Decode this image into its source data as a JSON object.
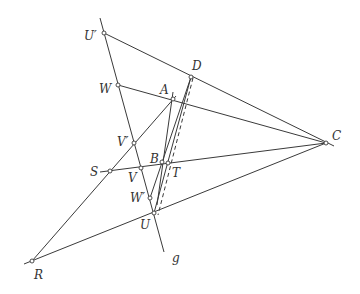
{
  "diagram": {
    "type": "projective-geometry-construction",
    "labels": {
      "U_prime": "U′",
      "D": "D",
      "W": "W",
      "A": "A",
      "C": "C",
      "V_prime": "V′",
      "S": "S",
      "B": "B",
      "T": "T",
      "V": "V",
      "W_prime": "W′",
      "U": "U",
      "R": "R",
      "g": "g"
    },
    "points": [
      {
        "name": "U′",
        "x": 104,
        "y": 33
      },
      {
        "name": "D",
        "x": 191,
        "y": 77
      },
      {
        "name": "W",
        "x": 118,
        "y": 85
      },
      {
        "name": "A",
        "x": 173,
        "y": 99
      },
      {
        "name": "C",
        "x": 326,
        "y": 143
      },
      {
        "name": "V′",
        "x": 134,
        "y": 143
      },
      {
        "name": "S",
        "x": 110,
        "y": 171
      },
      {
        "name": "B",
        "x": 162,
        "y": 162
      },
      {
        "name": "T",
        "x": 168,
        "y": 163
      },
      {
        "name": "V",
        "x": 141,
        "y": 168
      },
      {
        "name": "W′",
        "x": 150,
        "y": 198
      },
      {
        "name": "U",
        "x": 154,
        "y": 213
      },
      {
        "name": "R",
        "x": 32,
        "y": 261
      }
    ],
    "lines": [
      {
        "name": "g",
        "from": "top (100,18)",
        "to": "bottom (164,252)"
      }
    ],
    "stroke_color": "#3a3a3a"
  }
}
